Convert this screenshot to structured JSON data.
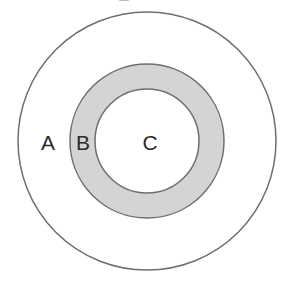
{
  "diagram": {
    "type": "concentric-regions",
    "colors": {
      "background": "#ffffff",
      "stroke": "#6e6e6e",
      "ring_fill": "#d4d4d4",
      "inner_fill": "#ffffff",
      "label": "#2a2a2a"
    },
    "regions": [
      {
        "id": "A",
        "label": "A",
        "description": "outer region (between outer circle and shaded ring)"
      },
      {
        "id": "B",
        "label": "B",
        "description": "shaded ring"
      },
      {
        "id": "C",
        "label": "C",
        "description": "inner circle"
      }
    ]
  }
}
